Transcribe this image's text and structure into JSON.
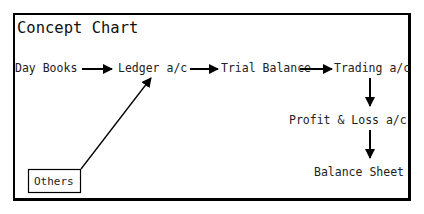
{
  "diagram": {
    "title": "Concept Chart",
    "nodes": {
      "day_books": "Day Books",
      "ledger": "Ledger a/c",
      "trial_balance": "Trial Balance",
      "trading": "Trading a/c",
      "profit_loss": "Profit & Loss a/c",
      "balance_sheet": "Balance Sheet",
      "others": "Others"
    },
    "edges": [
      {
        "from": "Day Books",
        "to": "Ledger a/c"
      },
      {
        "from": "Others",
        "to": "Ledger a/c"
      },
      {
        "from": "Ledger a/c",
        "to": "Trial Balance"
      },
      {
        "from": "Trial Balance",
        "to": "Trading a/c"
      },
      {
        "from": "Trading a/c",
        "to": "Profit & Loss a/c"
      },
      {
        "from": "Profit & Loss a/c",
        "to": "Balance Sheet"
      }
    ],
    "colors": {
      "line": "#000000",
      "text": "#222222",
      "background": "#ffffff"
    }
  }
}
